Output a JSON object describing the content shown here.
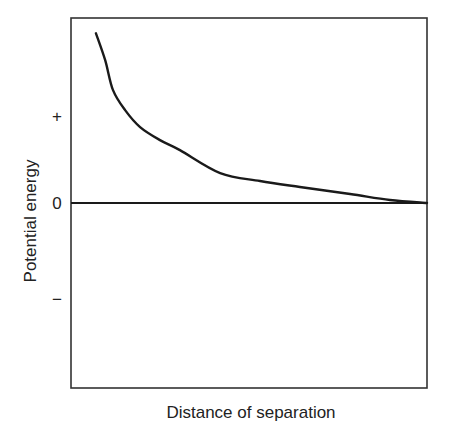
{
  "chart_data": {
    "type": "line",
    "title": "",
    "xlabel": "Distance of separation",
    "ylabel": "Potential energy",
    "xlim": [
      0,
      1
    ],
    "ylim": [
      -2.13,
      2.13
    ],
    "grid": false,
    "legend": null,
    "y_ticks": [
      {
        "value": 1,
        "label": "+"
      },
      {
        "value": 0,
        "label": "0"
      },
      {
        "value": -1.1,
        "label": "−"
      }
    ],
    "reference_lines": [
      {
        "name": "zero-line",
        "y": 0
      }
    ],
    "series": [
      {
        "name": "potential-energy-curve",
        "x": [
          0.07,
          0.096,
          0.118,
          0.152,
          0.194,
          0.25,
          0.306,
          0.419,
          0.531,
          0.643,
          0.784,
          0.896,
          1.0
        ],
        "y": [
          1.954,
          1.644,
          1.299,
          1.069,
          0.874,
          0.724,
          0.609,
          0.345,
          0.253,
          0.184,
          0.103,
          0.034,
          0.0
        ]
      }
    ],
    "colors": {
      "line": "#1a1a1a",
      "frame": "#333333"
    }
  }
}
